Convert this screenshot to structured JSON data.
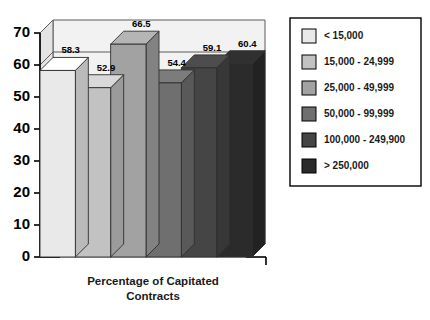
{
  "chart_data": {
    "type": "bar",
    "title": "",
    "xlabel": "Percentage of Capitated Contracts",
    "ylabel": "",
    "ylim": [
      0,
      70
    ],
    "yticks": [
      0,
      10,
      20,
      30,
      40,
      50,
      60,
      70
    ],
    "grid": true,
    "three_d": true,
    "legend_position": "right",
    "categories": [
      "< 15,000",
      "15,000 - 24,999",
      "25,000 - 49,999",
      "50,000 - 99,999",
      "100,000 - 249,900",
      "> 250,000"
    ],
    "values": [
      58.3,
      52.9,
      66.5,
      54.4,
      59.1,
      60.4
    ],
    "value_labels": [
      "58.3",
      "52.9",
      "66.5",
      "54.4",
      "59.1",
      "60.4"
    ],
    "colors": [
      "#e9e9e9",
      "#c2c2c2",
      "#a2a2a2",
      "#6f6f6f",
      "#454545",
      "#2b2b2b"
    ]
  },
  "axis": {
    "tick_labels": [
      "70",
      "60",
      "50",
      "40",
      "30",
      "20",
      "10",
      "0"
    ],
    "x_title_line1": "Percentage of Capitated",
    "x_title_line2": "Contracts"
  },
  "legend": {
    "items": [
      {
        "label": "< 15,000",
        "color": "#e9e9e9"
      },
      {
        "label": "15,000 - 24,999",
        "color": "#c2c2c2"
      },
      {
        "label": "25,000 - 49,999",
        "color": "#a2a2a2"
      },
      {
        "label": "50,000 - 99,999",
        "color": "#6f6f6f"
      },
      {
        "label": "100,000 - 249,900",
        "color": "#454545"
      },
      {
        "label": "> 250,000",
        "color": "#2b2b2b"
      }
    ]
  }
}
